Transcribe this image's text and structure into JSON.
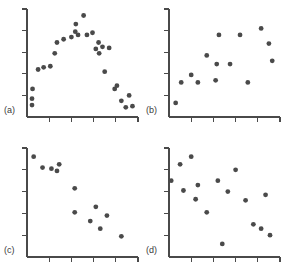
{
  "figure": {
    "background_color": "#ffffff",
    "axis_color": "#4a4a4a",
    "point_color": "#4a4a4a",
    "label_color": "#3a3a3a",
    "point_radius": 2.4,
    "axis_width": 1.3,
    "tick_length": 5,
    "width": 284,
    "height": 279
  },
  "chart_data": [
    {
      "type": "scatter",
      "title": "",
      "panel_label": "(a)",
      "xlabel": "",
      "ylabel": "",
      "xlim": [
        0,
        10
      ],
      "ylim": [
        0,
        10
      ],
      "grid": false,
      "legend": "none",
      "xticks": [
        2,
        4,
        6,
        8
      ],
      "yticks": [
        2,
        4,
        6,
        8
      ],
      "x": [
        0.45,
        0.45,
        0.5,
        1.0,
        1.5,
        2.1,
        2.5,
        2.7,
        3.3,
        4.0,
        4.35,
        4.4,
        4.6,
        5.1,
        5.4,
        5.9,
        6.2,
        6.45,
        6.5,
        6.8,
        7.0,
        7.4,
        7.9,
        8.1,
        8.5,
        8.9,
        9.2,
        9.5
      ],
      "y": [
        1.1,
        1.7,
        2.6,
        4.4,
        4.6,
        4.7,
        5.9,
        6.9,
        7.2,
        7.4,
        7.9,
        8.6,
        7.6,
        9.4,
        7.6,
        7.8,
        6.3,
        6.9,
        5.9,
        6.5,
        4.2,
        6.4,
        2.6,
        2.9,
        1.5,
        0.9,
        2.0,
        1.0
      ]
    },
    {
      "type": "scatter",
      "title": "",
      "panel_label": "(b)",
      "xlabel": "",
      "ylabel": "",
      "xlim": [
        0,
        10
      ],
      "ylim": [
        0,
        10
      ],
      "grid": false,
      "legend": "none",
      "xticks": [
        2,
        4,
        6,
        8
      ],
      "yticks": [
        2,
        4,
        6,
        8
      ],
      "x": [
        0.6,
        1.1,
        2.0,
        2.6,
        3.4,
        4.2,
        4.3,
        4.5,
        5.5,
        6.4,
        7.1,
        8.3,
        9.0,
        9.3
      ],
      "y": [
        1.3,
        3.2,
        3.9,
        3.2,
        5.7,
        3.4,
        4.9,
        7.6,
        4.9,
        7.6,
        3.2,
        8.2,
        6.8,
        5.2
      ]
    },
    {
      "type": "scatter",
      "title": "",
      "panel_label": "(c)",
      "xlabel": "",
      "ylabel": "",
      "xlim": [
        0,
        10
      ],
      "ylim": [
        0,
        10
      ],
      "grid": false,
      "legend": "none",
      "xticks": [
        2,
        4,
        6,
        8
      ],
      "yticks": [
        2,
        4,
        6,
        8
      ],
      "x": [
        0.6,
        1.4,
        2.2,
        2.7,
        2.9,
        4.3,
        4.3,
        5.7,
        6.2,
        6.6,
        7.2,
        8.5
      ],
      "y": [
        9.2,
        8.2,
        8.1,
        7.9,
        8.5,
        6.3,
        4.1,
        3.3,
        4.6,
        2.6,
        3.8,
        1.9
      ]
    },
    {
      "type": "scatter",
      "title": "",
      "panel_label": "(d)",
      "xlabel": "",
      "ylabel": "",
      "xlim": [
        0,
        10
      ],
      "ylim": [
        0,
        10
      ],
      "grid": false,
      "legend": "none",
      "xticks": [
        2,
        4,
        6,
        8
      ],
      "yticks": [
        2,
        4,
        6,
        8
      ],
      "x": [
        0.2,
        1.0,
        1.3,
        2.0,
        2.4,
        2.6,
        3.4,
        4.4,
        4.8,
        5.3,
        6.0,
        6.9,
        7.6,
        8.3,
        8.7,
        9.1
      ],
      "y": [
        7.0,
        8.5,
        6.1,
        9.2,
        5.3,
        6.6,
        4.1,
        7.0,
        1.2,
        6.0,
        8.0,
        5.2,
        3.0,
        2.6,
        5.7,
        2.0
      ]
    }
  ],
  "panels": [
    {
      "id": "a",
      "label": "(a)",
      "left": 0,
      "top": 0,
      "width": 142,
      "height": 139
    },
    {
      "id": "b",
      "label": "(b)",
      "left": 142,
      "top": 0,
      "width": 142,
      "height": 139
    },
    {
      "id": "c",
      "label": "(c)",
      "left": 0,
      "top": 139,
      "width": 142,
      "height": 140
    },
    {
      "id": "d",
      "label": "(d)",
      "left": 142,
      "top": 139,
      "width": 142,
      "height": 140
    }
  ]
}
